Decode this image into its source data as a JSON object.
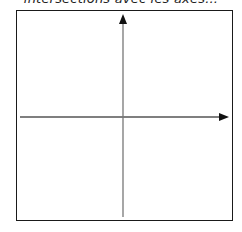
{
  "title": "intersections avec les axes...",
  "diagram": {
    "type": "coordinate-axes",
    "frame": {
      "x": 16,
      "y": 10,
      "width": 217,
      "height": 211
    },
    "x_axis": {
      "y": 117,
      "x_start": 20,
      "x_end": 229,
      "arrow": "right"
    },
    "y_axis": {
      "x": 123,
      "y_start": 217,
      "y_end": 14,
      "arrow": "up"
    },
    "colors": {
      "axis": "#555555",
      "arrow": "#111111",
      "frame": "#1a1a1a"
    }
  }
}
